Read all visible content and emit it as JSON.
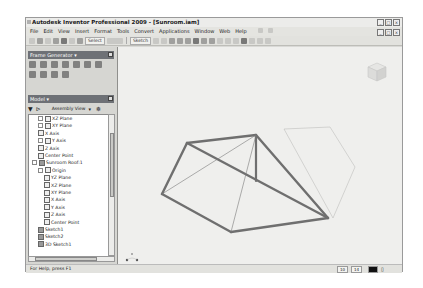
{
  "window": {
    "title": "Autodesk Inventor Professional 2009 - [Sunroom.iam]",
    "controls": [
      "_",
      "□",
      "×"
    ],
    "doc_controls": [
      "_",
      "□",
      "×"
    ]
  },
  "menu": {
    "items": [
      "File",
      "Edit",
      "View",
      "Insert",
      "Format",
      "Tools",
      "Convert",
      "Applications",
      "Window",
      "Web",
      "Help"
    ]
  },
  "toolbar": {
    "select_label": "Select",
    "sketch_label": "Sketch"
  },
  "frame_generator": {
    "title": "Frame Generator ▾",
    "icon_count": 11
  },
  "model_panel": {
    "title": "Model ▾",
    "view_label": "Assembly View",
    "filter_icon": "filter-icon",
    "find_icon": "binoculars-icon"
  },
  "tree": [
    {
      "label": "XZ Plane",
      "indent": 1,
      "expand": true,
      "icon": "plane"
    },
    {
      "label": "XY Plane",
      "indent": 1,
      "expand": true,
      "icon": "plane"
    },
    {
      "label": "X Axis",
      "indent": 1,
      "expand": false,
      "icon": "axis"
    },
    {
      "label": "Y Axis",
      "indent": 1,
      "expand": true,
      "icon": "axis"
    },
    {
      "label": "Z Axis",
      "indent": 1,
      "expand": false,
      "icon": "axis"
    },
    {
      "label": "Center Point",
      "indent": 1,
      "expand": false,
      "icon": "point"
    },
    {
      "label": "Sunroom Roof:1",
      "indent": 0,
      "expand": true,
      "icon": "part"
    },
    {
      "label": "Origin",
      "indent": 1,
      "expand": true,
      "icon": "folder"
    },
    {
      "label": "YZ Plane",
      "indent": 2,
      "expand": false,
      "icon": "plane"
    },
    {
      "label": "XZ Plane",
      "indent": 2,
      "expand": false,
      "icon": "plane"
    },
    {
      "label": "XY Plane",
      "indent": 2,
      "expand": false,
      "icon": "plane"
    },
    {
      "label": "X Axis",
      "indent": 2,
      "expand": false,
      "icon": "axis"
    },
    {
      "label": "Y Axis",
      "indent": 2,
      "expand": false,
      "icon": "axis"
    },
    {
      "label": "Z Axis",
      "indent": 2,
      "expand": false,
      "icon": "axis"
    },
    {
      "label": "Center Point",
      "indent": 2,
      "expand": false,
      "icon": "point"
    },
    {
      "label": "Sketch1",
      "indent": 1,
      "expand": false,
      "icon": "sketch"
    },
    {
      "label": "Sketch2",
      "indent": 1,
      "expand": false,
      "icon": "sketch"
    },
    {
      "label": "3D Sketch1",
      "indent": 1,
      "expand": false,
      "icon": "sketch3d"
    }
  ],
  "status": {
    "help": "For Help, press F1",
    "cell1": "10",
    "cell2": "14"
  },
  "colors": {
    "panel_header": "#6e7176",
    "viewport_bg": "#efefed",
    "frame_member": "#6f6f6f"
  }
}
